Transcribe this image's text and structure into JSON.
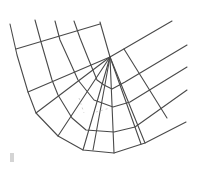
{
  "diagram": {
    "type": "structured-mesh",
    "colors": {
      "line": "#4a4a4a",
      "background": "#ffffff",
      "faint": "#c8c8c8",
      "marker": "#d4d4d4"
    },
    "hub": [
      110,
      57
    ],
    "polylines": [
      [
        [
          10,
          24
        ],
        [
          17,
          55
        ],
        [
          28,
          92
        ],
        [
          36,
          113
        ],
        [
          58,
          136
        ],
        [
          83,
          150
        ],
        [
          114,
          153
        ],
        [
          145,
          143
        ],
        [
          186,
          122
        ]
      ],
      [
        [
          35,
          20
        ],
        [
          41,
          42
        ],
        [
          52,
          80
        ],
        [
          58,
          95
        ],
        [
          72,
          118
        ],
        [
          86,
          130
        ],
        [
          114,
          132
        ],
        [
          135,
          127
        ],
        [
          187,
          90
        ]
      ],
      [
        [
          55,
          21
        ],
        [
          60,
          40
        ],
        [
          70,
          62
        ],
        [
          78,
          80
        ],
        [
          94,
          100
        ],
        [
          113,
          107
        ],
        [
          130,
          102
        ],
        [
          187,
          67
        ]
      ],
      [
        [
          74,
          21
        ],
        [
          80,
          38
        ],
        [
          88,
          58
        ],
        [
          97,
          80
        ],
        [
          104,
          85
        ],
        [
          112,
          89
        ],
        [
          125,
          82
        ],
        [
          187,
          45
        ]
      ],
      [
        [
          100,
          22
        ],
        [
          104,
          36
        ],
        [
          110,
          57
        ],
        [
          172,
          21
        ]
      ],
      [
        [
          16,
          49
        ],
        [
          100,
          24
        ]
      ],
      [
        [
          28,
          92
        ],
        [
          110,
          57
        ]
      ],
      [
        [
          36,
          113
        ],
        [
          110,
          57
        ]
      ],
      [
        [
          58,
          136
        ],
        [
          110,
          57
        ]
      ],
      [
        [
          83,
          150
        ],
        [
          110,
          57
        ]
      ],
      [
        [
          93,
          150
        ],
        [
          110,
          57
        ]
      ],
      [
        [
          114,
          153
        ],
        [
          110,
          57
        ]
      ],
      [
        [
          145,
          143
        ],
        [
          110,
          57
        ]
      ],
      [
        [
          141,
          144
        ],
        [
          110,
          57
        ]
      ],
      [
        [
          124,
          49
        ],
        [
          167,
          118
        ]
      ]
    ],
    "faint_marks": [
      [
        [
          79,
          98
        ],
        [
          84,
          113
        ]
      ],
      [
        [
          96,
          112
        ],
        [
          110,
          108
        ]
      ]
    ],
    "marker": {
      "x": 10,
      "y": 153,
      "w": 4,
      "h": 9
    }
  }
}
